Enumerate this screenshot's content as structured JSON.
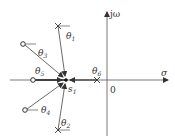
{
  "diagram": {
    "type": "s-plane root locus angle diagram",
    "axes": {
      "real_label": "σ",
      "imag_label": "jω",
      "origin_label": "0"
    },
    "test_point": {
      "label": "s",
      "subscript": "1"
    },
    "poles": [
      {
        "id": "p1",
        "angle_label": "θ",
        "subscript": "1"
      },
      {
        "id": "p2",
        "angle_label": "θ",
        "subscript": "2"
      },
      {
        "id": "p6",
        "angle_label": "θ",
        "subscript": "6"
      }
    ],
    "zeros": [
      {
        "id": "z3",
        "angle_label": "θ",
        "subscript": "3"
      },
      {
        "id": "z4",
        "angle_label": "θ",
        "subscript": "4"
      },
      {
        "id": "z5",
        "angle_label": "θ",
        "subscript": "5"
      }
    ],
    "colors": {
      "line": "#444444",
      "text": "#333333",
      "background": "#ffffff"
    }
  }
}
